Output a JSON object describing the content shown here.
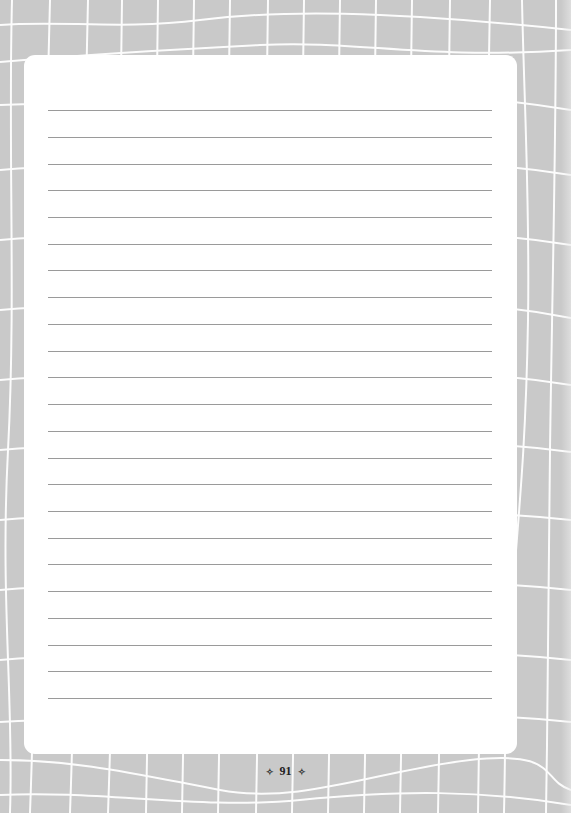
{
  "page": {
    "number": "91",
    "ornament_left": "✧",
    "ornament_right": "✧",
    "line_count": 23,
    "colors": {
      "background": "#c9c9c9",
      "grid": "#ffffff",
      "panel": "#ffffff",
      "rule": "#9a9a9a"
    }
  }
}
